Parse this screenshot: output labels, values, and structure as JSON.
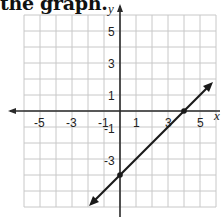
{
  "header": {
    "text": "the graph."
  },
  "chart_data": {
    "type": "line",
    "title": "the graph.",
    "xlabel": "x",
    "ylabel": "y",
    "xlim": [
      -6,
      6
    ],
    "ylim": [
      -6,
      6
    ],
    "grid": true,
    "x_tick_labels": [
      "-5",
      "-3",
      "-1",
      "1",
      "3",
      "5"
    ],
    "y_tick_labels": [
      "5",
      "3",
      "1",
      "-1",
      "-3"
    ],
    "series": [
      {
        "name": "line",
        "equation": "y = x - 4",
        "slope": 1,
        "y_intercept": -4,
        "x_intercept": 4,
        "marked_points": [
          [
            0,
            -4
          ],
          [
            4,
            0
          ]
        ],
        "arrows": "both ends",
        "x": [
          -2,
          0,
          4,
          5.8
        ],
        "y": [
          -6,
          -4,
          0,
          1.8
        ]
      }
    ]
  },
  "colors": {
    "grid": "#c8c8c8",
    "axis": "#2a2a2a",
    "line": "#1a1a1a"
  }
}
